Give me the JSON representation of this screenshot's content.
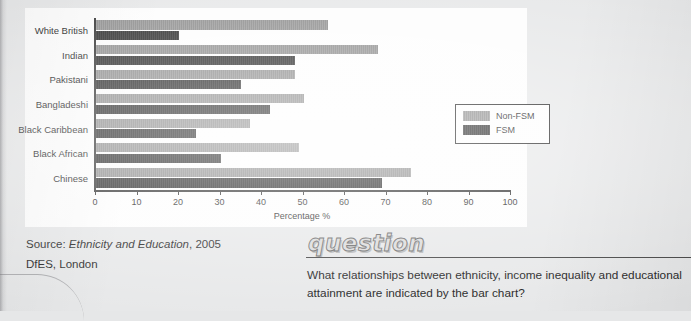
{
  "chart_data": {
    "type": "bar",
    "orientation": "horizontal",
    "title": "",
    "xlabel": "Percentage %",
    "ylabel": "",
    "xlim": [
      0,
      100
    ],
    "xticks": [
      0,
      10,
      20,
      30,
      40,
      50,
      60,
      70,
      80,
      90,
      100
    ],
    "grid": false,
    "legend_position": "right-middle",
    "categories": [
      "White British",
      "Indian",
      "Pakistani",
      "Bangladeshi",
      "Black Caribbean",
      "Black African",
      "Chinese"
    ],
    "series": [
      {
        "name": "Non-FSM",
        "color": "#8c8c8c",
        "values": [
          56,
          68,
          48,
          50,
          37,
          49,
          76
        ]
      },
      {
        "name": "FSM",
        "color": "#232323",
        "values": [
          20,
          48,
          35,
          42,
          24,
          30,
          69
        ]
      }
    ]
  },
  "source": {
    "line1_prefix": "Source: ",
    "line1_italic": "Ethnicity and Education",
    "line1_suffix": ", 2005",
    "line2": "DfES, London"
  },
  "question": {
    "heading": "question",
    "text": "What relationships between ethnicity, income inequality and educational attainment are indicated by the bar chart?"
  }
}
